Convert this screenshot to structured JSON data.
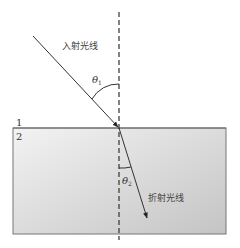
{
  "diagram": {
    "type": "refraction",
    "labels": {
      "incident_ray": "入射光线",
      "refracted_ray": "折射光线",
      "medium_1": "1",
      "medium_2": "2",
      "angle_incidence": "θ",
      "angle_incidence_sub": "1",
      "angle_refraction": "θ",
      "angle_refraction_sub": "2"
    },
    "colors": {
      "line": "#333333",
      "medium_2_fill_top": "#f2f2f2",
      "medium_2_fill_bottom": "#c8c8c8",
      "border": "#777777"
    }
  }
}
